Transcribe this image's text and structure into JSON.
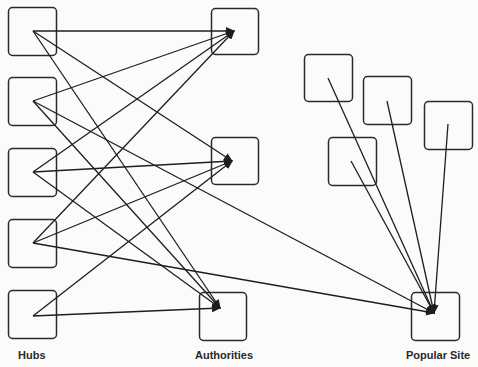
{
  "labels": {
    "hubs": "Hubs",
    "authorities": "Authorities",
    "popular_site": "Popular Site"
  },
  "style": {
    "line_color": "#1e1e1e",
    "box_color": "#2a2a2a",
    "background": "#fbfbfa"
  },
  "nodes": [
    {
      "id": "hub1",
      "group": "hubs",
      "x": 8,
      "y": 7,
      "w": 48,
      "h": 48,
      "anchor": [
        33,
        31
      ]
    },
    {
      "id": "hub2",
      "group": "hubs",
      "x": 8,
      "y": 77,
      "w": 48,
      "h": 48,
      "anchor": [
        33,
        101
      ]
    },
    {
      "id": "hub3",
      "group": "hubs",
      "x": 8,
      "y": 148,
      "w": 48,
      "h": 48,
      "anchor": [
        33,
        172
      ]
    },
    {
      "id": "hub4",
      "group": "hubs",
      "x": 8,
      "y": 219,
      "w": 48,
      "h": 48,
      "anchor": [
        33,
        243
      ]
    },
    {
      "id": "hub5",
      "group": "hubs",
      "x": 8,
      "y": 290,
      "w": 48,
      "h": 48,
      "anchor": [
        33,
        316
      ]
    },
    {
      "id": "auth1",
      "group": "authorities",
      "x": 211,
      "y": 8,
      "w": 47,
      "h": 46,
      "anchor": [
        234,
        31
      ]
    },
    {
      "id": "auth2",
      "group": "authorities",
      "x": 211,
      "y": 137,
      "w": 47,
      "h": 47,
      "anchor": [
        232,
        161
      ]
    },
    {
      "id": "auth3",
      "group": "authorities",
      "x": 199,
      "y": 292,
      "w": 47,
      "h": 48,
      "anchor": [
        220,
        308
      ]
    },
    {
      "id": "siteA",
      "group": "other",
      "x": 304,
      "y": 54,
      "w": 48,
      "h": 47,
      "anchor": [
        328,
        78
      ]
    },
    {
      "id": "siteB",
      "group": "other",
      "x": 363,
      "y": 76,
      "w": 48,
      "h": 48,
      "anchor": [
        387,
        101
      ]
    },
    {
      "id": "siteC",
      "group": "other",
      "x": 424,
      "y": 101,
      "w": 48,
      "h": 48,
      "anchor": [
        448,
        124
      ]
    },
    {
      "id": "siteD",
      "group": "other",
      "x": 328,
      "y": 137,
      "w": 48,
      "h": 48,
      "anchor": [
        351,
        161
      ]
    },
    {
      "id": "popular",
      "group": "popular_site",
      "x": 411,
      "y": 292,
      "w": 48,
      "h": 48,
      "anchor": [
        434,
        313
      ]
    }
  ],
  "edges": [
    {
      "from": "hub1",
      "to": "auth1",
      "arrow": true
    },
    {
      "from": "hub1",
      "to": "auth2",
      "arrow": true
    },
    {
      "from": "hub1",
      "to": "auth3",
      "arrow": true
    },
    {
      "from": "hub2",
      "to": "auth1",
      "arrow": true
    },
    {
      "from": "hub2",
      "to": "auth3",
      "arrow": true
    },
    {
      "from": "hub2",
      "to": "popular",
      "arrow": true
    },
    {
      "from": "hub3",
      "to": "auth1",
      "arrow": true
    },
    {
      "from": "hub3",
      "to": "auth2",
      "arrow": true
    },
    {
      "from": "hub3",
      "to": "auth3",
      "arrow": true
    },
    {
      "from": "hub4",
      "to": "auth1",
      "arrow": true
    },
    {
      "from": "hub4",
      "to": "auth2",
      "arrow": true
    },
    {
      "from": "hub4",
      "to": "popular",
      "arrow": true
    },
    {
      "from": "hub5",
      "to": "auth2",
      "arrow": true
    },
    {
      "from": "hub5",
      "to": "auth3",
      "arrow": true
    },
    {
      "from": "siteA",
      "to": "popular",
      "arrow": true
    },
    {
      "from": "siteB",
      "to": "popular",
      "arrow": true
    },
    {
      "from": "siteC",
      "to": "popular",
      "arrow": true
    },
    {
      "from": "siteD",
      "to": "popular",
      "arrow": true
    }
  ]
}
